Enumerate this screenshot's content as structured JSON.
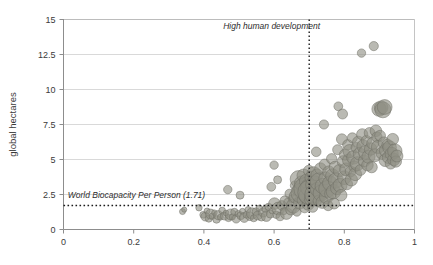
{
  "chart": {
    "type": "scatter",
    "title": "",
    "xlabel": "",
    "ylabel": "global hectares",
    "xlim": [
      0,
      1
    ],
    "ylim": [
      0,
      15
    ],
    "xticks": [
      "0",
      "0.2",
      "0.4",
      "0.6",
      "0.8",
      "1"
    ],
    "xtick_values": [
      0,
      0.2,
      0.4,
      0.6,
      0.8,
      1
    ],
    "yticks": [
      "0",
      "2.5",
      "5",
      "7.5",
      "10",
      "12.5",
      "15"
    ],
    "ytick_values": [
      0,
      2.5,
      5,
      7.5,
      10,
      12.5,
      15
    ],
    "grid": "horizontal",
    "legend": "none",
    "marker_color": "#8f8f84",
    "marker_edge_color": "#6f6f66",
    "marker_opacity": 0.62,
    "annotations": [
      {
        "name": "world-biocapacity-line",
        "text": "World Biocapacity Per Person (1.71)",
        "orientation": "horizontal",
        "value": 1.71,
        "style": "dotted",
        "label_x": 0.012,
        "label_y": 2.25
      },
      {
        "name": "high-human-development-line",
        "text": "High human development",
        "orientation": "vertical",
        "value": 0.7,
        "style": "dotted",
        "label_x": 0.455,
        "label_y": 14.35
      }
    ],
    "points": [
      {
        "x": 0.339,
        "y": 1.28,
        "r": 3.0
      },
      {
        "x": 0.344,
        "y": 1.42,
        "r": 2.6
      },
      {
        "x": 0.386,
        "y": 1.55,
        "r": 3.2
      },
      {
        "x": 0.398,
        "y": 1.05,
        "r": 3.4
      },
      {
        "x": 0.404,
        "y": 0.92,
        "r": 4.4
      },
      {
        "x": 0.409,
        "y": 1.32,
        "r": 3.0
      },
      {
        "x": 0.414,
        "y": 0.78,
        "r": 3.6
      },
      {
        "x": 0.419,
        "y": 1.1,
        "r": 5.0
      },
      {
        "x": 0.424,
        "y": 0.95,
        "r": 3.2
      },
      {
        "x": 0.43,
        "y": 1.2,
        "r": 2.8
      },
      {
        "x": 0.436,
        "y": 0.72,
        "r": 3.8
      },
      {
        "x": 0.441,
        "y": 1.02,
        "r": 4.6
      },
      {
        "x": 0.447,
        "y": 0.88,
        "r": 3.0
      },
      {
        "x": 0.452,
        "y": 1.35,
        "r": 3.4
      },
      {
        "x": 0.458,
        "y": 0.96,
        "r": 4.0
      },
      {
        "x": 0.463,
        "y": 1.18,
        "r": 2.9
      },
      {
        "x": 0.468,
        "y": 2.85,
        "r": 4.2
      },
      {
        "x": 0.47,
        "y": 0.82,
        "r": 3.6
      },
      {
        "x": 0.476,
        "y": 1.08,
        "r": 5.4
      },
      {
        "x": 0.481,
        "y": 0.9,
        "r": 3.1
      },
      {
        "x": 0.487,
        "y": 1.25,
        "r": 3.7
      },
      {
        "x": 0.492,
        "y": 0.76,
        "r": 4.2
      },
      {
        "x": 0.498,
        "y": 1.12,
        "r": 3.3
      },
      {
        "x": 0.503,
        "y": 2.45,
        "r": 4.0
      },
      {
        "x": 0.505,
        "y": 0.98,
        "r": 3.9
      },
      {
        "x": 0.51,
        "y": 1.3,
        "r": 3.0
      },
      {
        "x": 0.515,
        "y": 0.85,
        "r": 4.8
      },
      {
        "x": 0.521,
        "y": 1.05,
        "r": 3.4
      },
      {
        "x": 0.526,
        "y": 1.42,
        "r": 3.1
      },
      {
        "x": 0.531,
        "y": 0.94,
        "r": 4.2
      },
      {
        "x": 0.537,
        "y": 1.15,
        "r": 5.6
      },
      {
        "x": 0.542,
        "y": 0.8,
        "r": 3.5
      },
      {
        "x": 0.548,
        "y": 1.28,
        "r": 3.8
      },
      {
        "x": 0.553,
        "y": 1.0,
        "r": 4.4
      },
      {
        "x": 0.558,
        "y": 1.52,
        "r": 3.2
      },
      {
        "x": 0.564,
        "y": 0.88,
        "r": 3.9
      },
      {
        "x": 0.569,
        "y": 1.22,
        "r": 4.6
      },
      {
        "x": 0.575,
        "y": 1.45,
        "r": 3.4
      },
      {
        "x": 0.578,
        "y": 0.95,
        "r": 5.2
      },
      {
        "x": 0.584,
        "y": 1.62,
        "r": 3.6
      },
      {
        "x": 0.589,
        "y": 1.1,
        "r": 4.0
      },
      {
        "x": 0.592,
        "y": 3.05,
        "r": 4.4
      },
      {
        "x": 0.595,
        "y": 1.35,
        "r": 3.3
      },
      {
        "x": 0.6,
        "y": 4.6,
        "r": 4.2
      },
      {
        "x": 0.601,
        "y": 1.85,
        "r": 5.8
      },
      {
        "x": 0.606,
        "y": 1.05,
        "r": 3.7
      },
      {
        "x": 0.61,
        "y": 3.55,
        "r": 4.0
      },
      {
        "x": 0.612,
        "y": 1.5,
        "r": 6.4
      },
      {
        "x": 0.617,
        "y": 0.92,
        "r": 4.1
      },
      {
        "x": 0.622,
        "y": 1.72,
        "r": 4.8
      },
      {
        "x": 0.627,
        "y": 1.3,
        "r": 3.5
      },
      {
        "x": 0.631,
        "y": 2.05,
        "r": 5.0
      },
      {
        "x": 0.635,
        "y": 1.15,
        "r": 6.0
      },
      {
        "x": 0.64,
        "y": 1.95,
        "r": 4.3
      },
      {
        "x": 0.644,
        "y": 2.55,
        "r": 4.6
      },
      {
        "x": 0.648,
        "y": 1.42,
        "r": 5.4
      },
      {
        "x": 0.652,
        "y": 2.2,
        "r": 4.0
      },
      {
        "x": 0.655,
        "y": 1.68,
        "r": 7.2
      },
      {
        "x": 0.659,
        "y": 3.15,
        "r": 4.5
      },
      {
        "x": 0.662,
        "y": 2.35,
        "r": 6.8
      },
      {
        "x": 0.665,
        "y": 1.25,
        "r": 4.2
      },
      {
        "x": 0.668,
        "y": 2.8,
        "r": 5.6
      },
      {
        "x": 0.67,
        "y": 3.6,
        "r": 8.5
      },
      {
        "x": 0.673,
        "y": 1.9,
        "r": 6.2
      },
      {
        "x": 0.676,
        "y": 2.6,
        "r": 9.8
      },
      {
        "x": 0.679,
        "y": 3.3,
        "r": 7.4
      },
      {
        "x": 0.682,
        "y": 2.1,
        "r": 5.8
      },
      {
        "x": 0.684,
        "y": 3.85,
        "r": 6.6
      },
      {
        "x": 0.687,
        "y": 1.55,
        "r": 5.0
      },
      {
        "x": 0.689,
        "y": 2.9,
        "r": 11.5
      },
      {
        "x": 0.692,
        "y": 3.45,
        "r": 7.0
      },
      {
        "x": 0.694,
        "y": 2.4,
        "r": 8.2
      },
      {
        "x": 0.697,
        "y": 1.8,
        "r": 6.0
      },
      {
        "x": 0.699,
        "y": 4.2,
        "r": 5.4
      },
      {
        "x": 0.701,
        "y": 3.0,
        "r": 9.0
      },
      {
        "x": 0.703,
        "y": 2.65,
        "r": 12.5
      },
      {
        "x": 0.706,
        "y": 3.7,
        "r": 6.4
      },
      {
        "x": 0.708,
        "y": 2.2,
        "r": 7.6
      },
      {
        "x": 0.71,
        "y": 1.6,
        "r": 5.2
      },
      {
        "x": 0.713,
        "y": 4.0,
        "r": 6.8
      },
      {
        "x": 0.715,
        "y": 3.2,
        "r": 8.8
      },
      {
        "x": 0.717,
        "y": 2.5,
        "r": 10.4
      },
      {
        "x": 0.72,
        "y": 5.55,
        "r": 4.8
      },
      {
        "x": 0.722,
        "y": 3.9,
        "r": 6.0
      },
      {
        "x": 0.724,
        "y": 2.85,
        "r": 7.2
      },
      {
        "x": 0.727,
        "y": 2.05,
        "r": 5.6
      },
      {
        "x": 0.729,
        "y": 3.4,
        "r": 9.2
      },
      {
        "x": 0.732,
        "y": 4.35,
        "r": 5.8
      },
      {
        "x": 0.734,
        "y": 2.6,
        "r": 8.0
      },
      {
        "x": 0.737,
        "y": 1.95,
        "r": 6.2
      },
      {
        "x": 0.739,
        "y": 3.1,
        "r": 7.8
      },
      {
        "x": 0.742,
        "y": 7.5,
        "r": 4.6
      },
      {
        "x": 0.744,
        "y": 4.65,
        "r": 5.4
      },
      {
        "x": 0.746,
        "y": 3.65,
        "r": 6.6
      },
      {
        "x": 0.749,
        "y": 2.35,
        "r": 7.0
      },
      {
        "x": 0.751,
        "y": 2.9,
        "r": 8.4
      },
      {
        "x": 0.754,
        "y": 1.7,
        "r": 5.0
      },
      {
        "x": 0.756,
        "y": 4.1,
        "r": 6.2
      },
      {
        "x": 0.759,
        "y": 3.3,
        "r": 7.4
      },
      {
        "x": 0.761,
        "y": 2.55,
        "r": 6.0
      },
      {
        "x": 0.764,
        "y": 5.05,
        "r": 5.2
      },
      {
        "x": 0.766,
        "y": 3.85,
        "r": 6.8
      },
      {
        "x": 0.769,
        "y": 2.7,
        "r": 7.2
      },
      {
        "x": 0.771,
        "y": 1.85,
        "r": 5.4
      },
      {
        "x": 0.774,
        "y": 4.45,
        "r": 6.0
      },
      {
        "x": 0.776,
        "y": 3.5,
        "r": 7.6
      },
      {
        "x": 0.779,
        "y": 2.95,
        "r": 6.4
      },
      {
        "x": 0.781,
        "y": 5.7,
        "r": 5.0
      },
      {
        "x": 0.783,
        "y": 8.8,
        "r": 4.4
      },
      {
        "x": 0.786,
        "y": 4.2,
        "r": 6.2
      },
      {
        "x": 0.788,
        "y": 3.15,
        "r": 7.0
      },
      {
        "x": 0.791,
        "y": 2.45,
        "r": 5.8
      },
      {
        "x": 0.793,
        "y": 6.45,
        "r": 5.4
      },
      {
        "x": 0.795,
        "y": 8.25,
        "r": 5.0
      },
      {
        "x": 0.797,
        "y": 4.85,
        "r": 6.0
      },
      {
        "x": 0.8,
        "y": 3.7,
        "r": 6.8
      },
      {
        "x": 0.802,
        "y": 5.35,
        "r": 5.6
      },
      {
        "x": 0.805,
        "y": 4.3,
        "r": 6.4
      },
      {
        "x": 0.807,
        "y": 3.25,
        "r": 5.8
      },
      {
        "x": 0.81,
        "y": 6.05,
        "r": 5.2
      },
      {
        "x": 0.812,
        "y": 4.95,
        "r": 6.0
      },
      {
        "x": 0.815,
        "y": 5.6,
        "r": 6.6
      },
      {
        "x": 0.818,
        "y": 4.15,
        "r": 5.4
      },
      {
        "x": 0.82,
        "y": 3.55,
        "r": 6.2
      },
      {
        "x": 0.823,
        "y": 6.55,
        "r": 5.0
      },
      {
        "x": 0.826,
        "y": 5.15,
        "r": 6.8
      },
      {
        "x": 0.829,
        "y": 4.5,
        "r": 5.6
      },
      {
        "x": 0.831,
        "y": 3.95,
        "r": 6.4
      },
      {
        "x": 0.834,
        "y": 5.85,
        "r": 5.2
      },
      {
        "x": 0.837,
        "y": 4.7,
        "r": 7.0
      },
      {
        "x": 0.84,
        "y": 6.25,
        "r": 5.8
      },
      {
        "x": 0.843,
        "y": 5.4,
        "r": 6.2
      },
      {
        "x": 0.846,
        "y": 4.25,
        "r": 5.4
      },
      {
        "x": 0.849,
        "y": 12.6,
        "r": 4.2
      },
      {
        "x": 0.851,
        "y": 6.8,
        "r": 5.6
      },
      {
        "x": 0.854,
        "y": 5.95,
        "r": 6.4
      },
      {
        "x": 0.857,
        "y": 4.9,
        "r": 6.0
      },
      {
        "x": 0.86,
        "y": 5.5,
        "r": 6.8
      },
      {
        "x": 0.863,
        "y": 6.35,
        "r": 5.2
      },
      {
        "x": 0.866,
        "y": 4.6,
        "r": 5.8
      },
      {
        "x": 0.869,
        "y": 5.2,
        "r": 6.6
      },
      {
        "x": 0.872,
        "y": 6.9,
        "r": 5.4
      },
      {
        "x": 0.875,
        "y": 5.75,
        "r": 6.2
      },
      {
        "x": 0.878,
        "y": 4.45,
        "r": 5.6
      },
      {
        "x": 0.881,
        "y": 6.15,
        "r": 6.0
      },
      {
        "x": 0.884,
        "y": 13.1,
        "r": 4.6
      },
      {
        "x": 0.887,
        "y": 5.3,
        "r": 6.4
      },
      {
        "x": 0.89,
        "y": 7.05,
        "r": 5.8
      },
      {
        "x": 0.893,
        "y": 6.6,
        "r": 5.2
      },
      {
        "x": 0.896,
        "y": 5.9,
        "r": 6.6
      },
      {
        "x": 0.899,
        "y": 8.6,
        "r": 7.2
      },
      {
        "x": 0.905,
        "y": 8.7,
        "r": 6.8
      },
      {
        "x": 0.91,
        "y": 8.55,
        "r": 8.0
      },
      {
        "x": 0.915,
        "y": 8.75,
        "r": 7.4
      },
      {
        "x": 0.902,
        "y": 6.7,
        "r": 5.4
      },
      {
        "x": 0.908,
        "y": 5.45,
        "r": 6.2
      },
      {
        "x": 0.913,
        "y": 6.2,
        "r": 5.8
      },
      {
        "x": 0.917,
        "y": 4.95,
        "r": 6.4
      },
      {
        "x": 0.92,
        "y": 5.65,
        "r": 7.0
      },
      {
        "x": 0.923,
        "y": 6.05,
        "r": 5.6
      },
      {
        "x": 0.926,
        "y": 5.15,
        "r": 6.2
      },
      {
        "x": 0.929,
        "y": 5.85,
        "r": 6.8
      },
      {
        "x": 0.932,
        "y": 4.7,
        "r": 5.4
      },
      {
        "x": 0.935,
        "y": 5.4,
        "r": 6.6
      },
      {
        "x": 0.938,
        "y": 6.45,
        "r": 5.8
      },
      {
        "x": 0.941,
        "y": 5.0,
        "r": 6.2
      },
      {
        "x": 0.944,
        "y": 5.6,
        "r": 7.2
      },
      {
        "x": 0.947,
        "y": 4.85,
        "r": 5.6
      },
      {
        "x": 0.95,
        "y": 5.25,
        "r": 6.0
      }
    ]
  }
}
